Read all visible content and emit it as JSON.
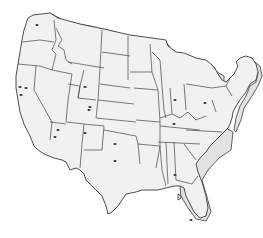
{
  "map": {
    "title": "",
    "subject": "Contiguous United States",
    "style": "3D extruded state outline map",
    "colors": {
      "land": "#f1f1f1",
      "extrusion": "#e2e2e2",
      "border": "#3a3a3a",
      "marker": "#333333",
      "background": "#ffffff"
    },
    "markers": [
      {
        "name": "marker-washington",
        "x": 37,
        "y": 25
      },
      {
        "name": "marker-california-1",
        "x": 20,
        "y": 87
      },
      {
        "name": "marker-california-2",
        "x": 26,
        "y": 88
      },
      {
        "name": "marker-california-3",
        "x": 21,
        "y": 95
      },
      {
        "name": "marker-wyoming",
        "x": 85,
        "y": 87
      },
      {
        "name": "marker-colorado-1",
        "x": 90,
        "y": 107
      },
      {
        "name": "marker-colorado-2",
        "x": 89,
        "y": 110
      },
      {
        "name": "marker-arizona-1",
        "x": 58,
        "y": 130
      },
      {
        "name": "marker-arizona-2",
        "x": 55,
        "y": 137
      },
      {
        "name": "marker-new-mexico",
        "x": 85,
        "y": 133
      },
      {
        "name": "marker-oklahoma",
        "x": 115,
        "y": 144
      },
      {
        "name": "marker-texas",
        "x": 115,
        "y": 161
      },
      {
        "name": "marker-georgia",
        "x": 175,
        "y": 175
      },
      {
        "name": "marker-ohio",
        "x": 174,
        "y": 124
      },
      {
        "name": "marker-michigan",
        "x": 175,
        "y": 100
      },
      {
        "name": "marker-northeast",
        "x": 205,
        "y": 103
      },
      {
        "name": "marker-florida",
        "x": 191,
        "y": 220
      }
    ]
  }
}
